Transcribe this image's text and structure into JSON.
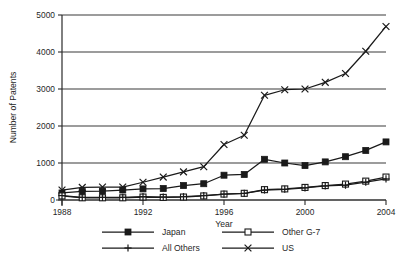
{
  "chart_data": {
    "type": "line",
    "title": "",
    "xlabel": "Year",
    "ylabel": "Number of Patents",
    "xlim": [
      1988,
      2004
    ],
    "ylim": [
      0,
      5000
    ],
    "grid": true,
    "legend_position": "bottom",
    "x": [
      1988,
      1989,
      1990,
      1991,
      1992,
      1993,
      1994,
      1995,
      1996,
      1997,
      1998,
      1999,
      2000,
      2001,
      2002,
      2003,
      2004
    ],
    "xticks": [
      1988,
      1992,
      1996,
      2000,
      2004
    ],
    "xtick_labels": [
      "1988",
      "1992",
      "1996",
      "2000",
      "2004"
    ],
    "yticks": [
      0,
      1000,
      2000,
      3000,
      4000,
      5000
    ],
    "ytick_labels": [
      "0",
      "1000",
      "2000",
      "3000",
      "4000",
      "5000"
    ],
    "series": [
      {
        "name": "Japan",
        "marker": "filled-square",
        "values": [
          190,
          230,
          240,
          270,
          300,
          310,
          390,
          440,
          670,
          690,
          1100,
          1000,
          930,
          1030,
          1170,
          1340,
          1570
        ]
      },
      {
        "name": "Other G-7",
        "marker": "open-square",
        "values": [
          110,
          60,
          60,
          60,
          80,
          70,
          80,
          110,
          160,
          180,
          280,
          300,
          340,
          390,
          430,
          510,
          620
        ]
      },
      {
        "name": "All Others",
        "marker": "plus",
        "values": [
          120,
          70,
          70,
          70,
          90,
          80,
          90,
          120,
          160,
          180,
          270,
          290,
          330,
          380,
          400,
          480,
          570
        ]
      },
      {
        "name": "US",
        "marker": "cross",
        "values": [
          270,
          340,
          350,
          350,
          480,
          620,
          760,
          900,
          1500,
          1750,
          2830,
          2980,
          3000,
          3180,
          3420,
          4020,
          4690
        ]
      }
    ]
  },
  "legend": {
    "entries": [
      {
        "label": "Japan",
        "marker": "filled-square"
      },
      {
        "label": "Other G-7",
        "marker": "open-square"
      },
      {
        "label": "All Others",
        "marker": "plus"
      },
      {
        "label": "US",
        "marker": "cross"
      }
    ]
  }
}
